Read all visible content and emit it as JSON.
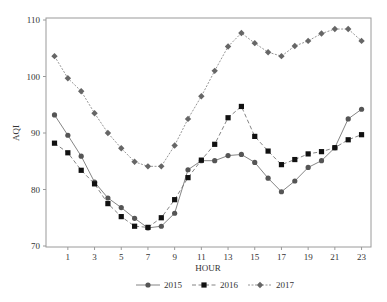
{
  "chart_data": {
    "type": "line",
    "title": "",
    "xlabel": "HOUR",
    "ylabel": "AQI",
    "x": [
      0,
      1,
      2,
      3,
      4,
      5,
      6,
      7,
      8,
      9,
      10,
      11,
      12,
      13,
      14,
      15,
      16,
      17,
      18,
      19,
      20,
      21,
      22,
      23
    ],
    "x_tick_labels": [
      "1",
      "3",
      "5",
      "7",
      "9",
      "11",
      "13",
      "15",
      "17",
      "19",
      "21",
      "23"
    ],
    "x_ticks": [
      1,
      3,
      5,
      7,
      9,
      11,
      13,
      15,
      17,
      19,
      21,
      23
    ],
    "xlim": [
      -0.5,
      23.6
    ],
    "ylim": [
      70,
      110
    ],
    "y_ticks": [
      70,
      80,
      90,
      100,
      110
    ],
    "y_tick_labels": [
      "70",
      "80",
      "90",
      "100",
      "110"
    ],
    "grid": false,
    "legend_position": "bottom-center",
    "series": [
      {
        "name": "2015",
        "marker": "circle",
        "line_style": "solid",
        "color": "#555555",
        "values": [
          93.2,
          89.6,
          85.9,
          81.3,
          78.5,
          76.8,
          74.9,
          73.2,
          73.5,
          75.8,
          83.5,
          85.1,
          85.1,
          86.0,
          86.2,
          84.8,
          82.0,
          79.6,
          81.5,
          83.9,
          85.1,
          87.4,
          92.5,
          94.2
        ]
      },
      {
        "name": "2016",
        "marker": "square",
        "line_style": "dashed",
        "color": "#111111",
        "values": [
          88.2,
          86.5,
          83.4,
          81.0,
          77.5,
          75.2,
          73.5,
          73.3,
          75.0,
          78.2,
          82.1,
          85.2,
          88.0,
          92.7,
          94.7,
          89.4,
          86.8,
          84.4,
          85.3,
          86.3,
          86.7,
          87.4,
          88.8,
          89.7
        ]
      },
      {
        "name": "2017",
        "marker": "diamond",
        "line_style": "dotted",
        "color": "#666666",
        "values": [
          103.6,
          99.7,
          97.4,
          93.5,
          90.0,
          87.3,
          84.9,
          84.1,
          84.1,
          87.8,
          92.5,
          96.5,
          101.0,
          105.3,
          107.7,
          105.9,
          104.3,
          103.6,
          105.4,
          106.3,
          107.6,
          108.4,
          108.4,
          106.3
        ]
      }
    ]
  }
}
